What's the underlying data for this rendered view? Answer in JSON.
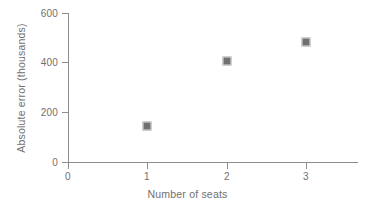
{
  "chart_data": {
    "type": "scatter",
    "title": "",
    "xlabel": "Number of seats",
    "ylabel": "Absolute error (thousands)",
    "x": [
      1,
      2,
      3
    ],
    "values": [
      145,
      405,
      485
    ],
    "series": [
      {
        "name": "Absolute error",
        "points": [
          {
            "x": 1,
            "y": 145
          },
          {
            "x": 2,
            "y": 405
          },
          {
            "x": 3,
            "y": 485
          }
        ],
        "marker": "square",
        "color": "#707070"
      }
    ],
    "xlim": [
      0,
      3.65
    ],
    "ylim": [
      0,
      600
    ],
    "xticks": [
      0,
      1,
      2,
      3
    ],
    "yticks": [
      0,
      200,
      400,
      600
    ],
    "xtick_labels": [
      "0",
      "1",
      "2",
      "3"
    ],
    "ytick_labels": [
      "0",
      "200",
      "400",
      "600"
    ],
    "grid": false,
    "legend": null,
    "axis_color": "#8d8d8d",
    "text_color": "#6f6f6f"
  }
}
